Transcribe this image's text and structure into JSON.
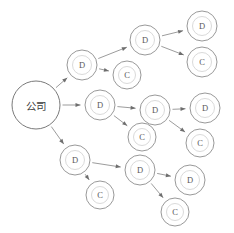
{
  "diagram": {
    "background_color": "#ffffff",
    "stroke_color": "#8d8d8d",
    "label_color": "#4a4a4a",
    "arrow_color": "#8a8a8a",
    "width": 234,
    "height": 233,
    "root_label": "公司",
    "distributor_label": "D",
    "customer_label": "C",
    "header_artifact_text": "",
    "nodes": [
      {
        "id": "root",
        "label": "公司",
        "kind": "root",
        "x": 36,
        "y": 105,
        "r": 24
      },
      {
        "id": "d_top",
        "label": "D",
        "kind": "distributor",
        "x": 82,
        "y": 65,
        "r": 15
      },
      {
        "id": "c_top",
        "label": "C",
        "kind": "customer",
        "x": 127,
        "y": 75,
        "r": 14
      },
      {
        "id": "d_top2",
        "label": "D",
        "kind": "distributor",
        "x": 145,
        "y": 40,
        "r": 15
      },
      {
        "id": "d_top3",
        "label": "D",
        "kind": "distributor",
        "x": 202,
        "y": 26,
        "r": 15
      },
      {
        "id": "c_top3",
        "label": "C",
        "kind": "customer",
        "x": 202,
        "y": 62,
        "r": 15
      },
      {
        "id": "d_mid",
        "label": "D",
        "kind": "distributor",
        "x": 100,
        "y": 105,
        "r": 15
      },
      {
        "id": "d_mid2",
        "label": "D",
        "kind": "distributor",
        "x": 155,
        "y": 110,
        "r": 15
      },
      {
        "id": "c_mid",
        "label": "C",
        "kind": "customer",
        "x": 142,
        "y": 137,
        "r": 14
      },
      {
        "id": "d_mid3",
        "label": "D",
        "kind": "distributor",
        "x": 205,
        "y": 108,
        "r": 15
      },
      {
        "id": "c_mid3",
        "label": "C",
        "kind": "customer",
        "x": 200,
        "y": 143,
        "r": 14
      },
      {
        "id": "d_bot",
        "label": "D",
        "kind": "distributor",
        "x": 75,
        "y": 160,
        "r": 15
      },
      {
        "id": "c_bot",
        "label": "C",
        "kind": "customer",
        "x": 100,
        "y": 195,
        "r": 14
      },
      {
        "id": "d_bot2",
        "label": "D",
        "kind": "distributor",
        "x": 140,
        "y": 170,
        "r": 15
      },
      {
        "id": "d_bot3",
        "label": "D",
        "kind": "distributor",
        "x": 190,
        "y": 180,
        "r": 15
      },
      {
        "id": "c_bot3",
        "label": "C",
        "kind": "customer",
        "x": 175,
        "y": 212,
        "r": 14
      }
    ],
    "edges": [
      {
        "from": "root",
        "to": "d_top"
      },
      {
        "from": "root",
        "to": "d_mid"
      },
      {
        "from": "root",
        "to": "d_bot"
      },
      {
        "from": "d_top",
        "to": "d_top2"
      },
      {
        "from": "d_top",
        "to": "c_top"
      },
      {
        "from": "d_top2",
        "to": "d_top3"
      },
      {
        "from": "d_top2",
        "to": "c_top3"
      },
      {
        "from": "d_mid",
        "to": "d_mid2"
      },
      {
        "from": "d_mid",
        "to": "c_mid"
      },
      {
        "from": "d_mid2",
        "to": "d_mid3"
      },
      {
        "from": "d_mid2",
        "to": "c_mid3"
      },
      {
        "from": "d_bot",
        "to": "d_bot2"
      },
      {
        "from": "d_bot",
        "to": "c_bot"
      },
      {
        "from": "d_bot2",
        "to": "d_bot3"
      },
      {
        "from": "d_bot2",
        "to": "c_bot3"
      }
    ]
  }
}
